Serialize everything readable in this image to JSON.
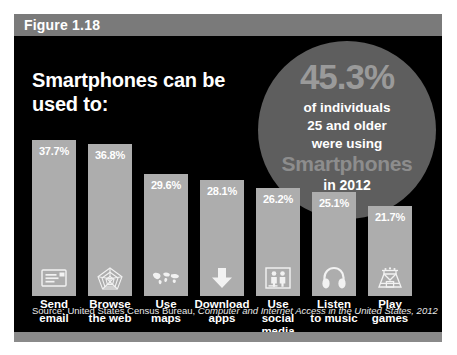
{
  "figure": {
    "number_label": "Figure 1.18",
    "headline": "Smartphones can be used to:",
    "source_prefix": "Source: United States Census Bureau, ",
    "source_title": "Computer and Internet Access in the United States, 2012"
  },
  "callout": {
    "percent": "45.3%",
    "line1": "of individuals",
    "line2": "25 and older",
    "line3": "were using",
    "brand": "Smartphones",
    "year": "in 2012"
  },
  "colors": {
    "background": "#000000",
    "header_bar": "#7a7a7a",
    "footer_bar": "#8a8a8a",
    "bar_fill": "#adadad",
    "circle_fill": "#5e5e5e",
    "callout_accent": "#9a9a9a",
    "text": "#ffffff"
  },
  "chart_data": {
    "type": "bar",
    "title": "Smartphones can be used to:",
    "xlabel": "",
    "ylabel": "",
    "ylim": [
      0,
      40
    ],
    "grid": false,
    "legend": "none",
    "categories": [
      "Send email",
      "Browse the web",
      "Use maps",
      "Download apps",
      "Use social media",
      "Listen to music",
      "Play games"
    ],
    "category_lines": [
      [
        "Send",
        "email"
      ],
      [
        "Browse",
        "the web"
      ],
      [
        "Use",
        "maps"
      ],
      [
        "Download",
        "apps"
      ],
      [
        "Use social",
        "media"
      ],
      [
        "Listen",
        "to music"
      ],
      [
        "Play",
        "games"
      ]
    ],
    "values": [
      37.7,
      36.8,
      29.6,
      28.1,
      26.2,
      25.1,
      21.7
    ],
    "value_labels": [
      "37.7%",
      "36.8%",
      "29.6%",
      "28.1%",
      "26.2%",
      "25.1%",
      "21.7%"
    ],
    "icons": [
      "email-icon",
      "web-globe-icon",
      "world-map-icon",
      "download-arrow-icon",
      "social-people-icon",
      "headphones-icon",
      "game-arcade-icon"
    ]
  }
}
